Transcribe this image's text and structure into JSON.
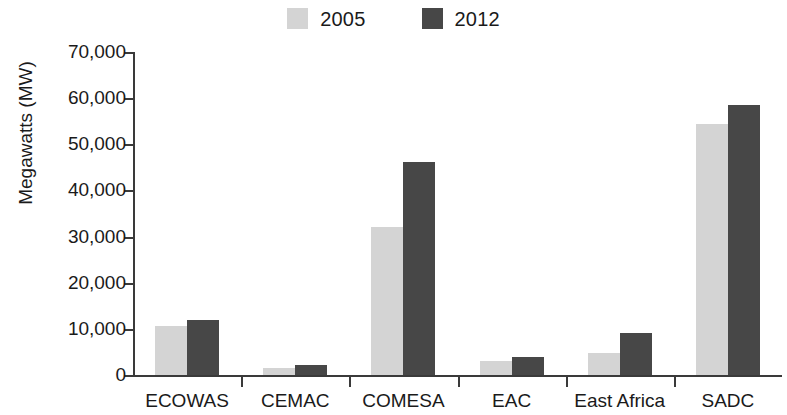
{
  "chart_data": {
    "type": "bar",
    "title": "",
    "subtitle": "",
    "xlabel": "",
    "ylabel": "Megawatts (MW)",
    "categories": [
      "ECOWAS",
      "CEMAC",
      "COMESA",
      "EAC",
      "East Africa",
      "SADC"
    ],
    "series": [
      {
        "name": "2005",
        "color": "#d4d4d4",
        "values": [
          10700,
          1500,
          32000,
          3000,
          4800,
          54500
        ]
      },
      {
        "name": "2012",
        "color": "#474747",
        "values": [
          12000,
          2200,
          46200,
          3900,
          9200,
          58500
        ]
      }
    ],
    "ylim": [
      0,
      70000
    ],
    "ytick_values": [
      0,
      10000,
      20000,
      30000,
      40000,
      50000,
      60000,
      70000
    ],
    "ytick_labels": [
      "0",
      "10,000",
      "20,000",
      "30,000",
      "40,000",
      "50,000",
      "60,000",
      "70,000"
    ],
    "grid": false,
    "legend_position": "top-center"
  },
  "legend": {
    "entries": [
      {
        "label": "2005",
        "swatch": "legend-swatch-2005"
      },
      {
        "label": "2012",
        "swatch": "legend-swatch-2012"
      }
    ]
  }
}
